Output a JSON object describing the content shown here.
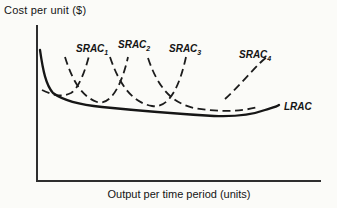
{
  "title": "Cost per unit ($)",
  "x_axis_label": "Output per time period (units)",
  "curve_labels": {
    "srac": [
      {
        "base": "SRAC",
        "sub": "1"
      },
      {
        "base": "SRAC",
        "sub": "2"
      },
      {
        "base": "SRAC",
        "sub": "3"
      },
      {
        "base": "SRAC",
        "sub": "4"
      }
    ],
    "lrac": "LRAC"
  },
  "colors": {
    "ink": "#1c1c1c",
    "axis": "#2e2e2e",
    "background": "#fbfbf8"
  },
  "paths": {
    "y_axis": "M 37 25 L 37 181",
    "x_axis": "M 36 181 L 321 181",
    "lrac": "M 40 50 C 43 71 46 85 53 93 C 64 101 82 105 102 107 C 142 111 180 114 214 116 C 238 117 254 114 265 110 C 271 108 276 107 279 105",
    "srac1": "M 42 90 C 54 96 63 97 71 93 C 79 88 85 71 89 56",
    "srac2": "M 65 57 C 73 83 83 97 97 102 C 111 106 122 84 128 57",
    "srac3": "M 110 57 C 120 87 134 103 152 106 C 170 109 180 84 186 57",
    "srac4_bottom": "M 148 58 C 158 88 172 103 194 108 C 216 112 240 112 258 107",
    "srac4_right_branch": "M 225 99 C 237 88 250 73 260 63 C 264 59 267 57 269 55"
  },
  "chart_data": {
    "type": "line",
    "title": "",
    "xlabel": "Output per time period (units)",
    "ylabel": "Cost per unit ($)",
    "axes_numeric": false,
    "grid": false,
    "legend": "inline-labels",
    "x_range": [
      0,
      100
    ],
    "y_range": [
      0,
      100
    ],
    "series": [
      {
        "name": "LRAC",
        "style": "solid",
        "x": [
          1,
          3,
          6,
          12,
          23,
          37,
          50,
          62,
          71,
          78,
          85
        ],
        "y": [
          84,
          67,
          56,
          50,
          47,
          45,
          43,
          42,
          42,
          44,
          49
        ]
      },
      {
        "name": "SRAC1",
        "style": "dashed",
        "x": [
          2,
          6,
          9,
          12,
          15,
          17,
          18
        ],
        "y": [
          58,
          54,
          54,
          56,
          60,
          70,
          80
        ]
      },
      {
        "name": "SRAC2",
        "style": "dashed",
        "x": [
          10,
          13,
          16,
          21,
          26,
          30,
          32
        ],
        "y": [
          79,
          63,
          54,
          51,
          49,
          62,
          79
        ]
      },
      {
        "name": "SRAC3",
        "style": "dashed",
        "x": [
          26,
          30,
          35,
          41,
          47,
          51,
          53
        ],
        "y": [
          79,
          60,
          50,
          48,
          46,
          62,
          79
        ]
      },
      {
        "name": "SRAC4-bottom",
        "style": "dashed",
        "x": [
          39,
          44,
          50,
          57,
          65,
          72,
          78
        ],
        "y": [
          79,
          57,
          49,
          46,
          44,
          44,
          47
        ]
      },
      {
        "name": "SRAC4-right-branch",
        "style": "dashed",
        "x": [
          66,
          71,
          75,
          79,
          82
        ],
        "y": [
          53,
          60,
          69,
          75,
          80
        ]
      }
    ]
  }
}
